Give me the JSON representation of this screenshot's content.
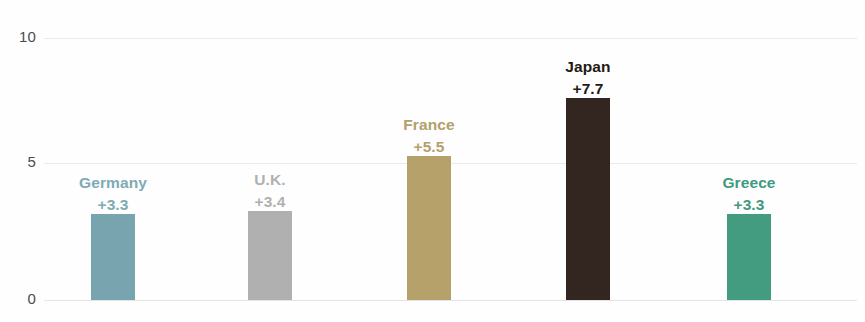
{
  "chart_data": {
    "type": "bar",
    "title": "",
    "subtitle": "",
    "xlabel": "",
    "ylabel": "",
    "ylim": [
      0,
      10
    ],
    "yticks": [
      "0",
      "5",
      "10"
    ],
    "grid": true,
    "legend": "none",
    "categories": [
      "Germany",
      "U.K.",
      "France",
      "Japan",
      "Greece"
    ],
    "values": [
      3.3,
      3.4,
      5.5,
      7.7,
      3.3
    ],
    "value_labels": [
      "+3.3",
      "+3.4",
      "+5.5",
      "+7.7",
      "+3.3"
    ],
    "bar_colors": [
      "#76a3ad",
      "#afafaf",
      "#b5a06a",
      "#332620",
      "#429b7f"
    ],
    "label_colors": [
      "#7cabb4",
      "#b0b0b0",
      "#b3a06b",
      "#231a16",
      "#3f9a80"
    ]
  },
  "axis": {
    "y_tick_10": "10",
    "y_tick_5": "5",
    "y_tick_0": "0"
  },
  "bars": [
    {
      "name": "Germany",
      "value_label": "+3.3"
    },
    {
      "name": "U.K.",
      "value_label": "+3.4"
    },
    {
      "name": "France",
      "value_label": "+5.5"
    },
    {
      "name": "Japan",
      "value_label": "+7.7"
    },
    {
      "name": "Greece",
      "value_label": "+3.3"
    }
  ]
}
